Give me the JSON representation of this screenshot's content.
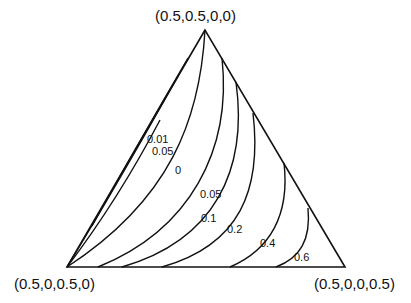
{
  "diagram": {
    "type": "ternary-contour",
    "vertices": {
      "top": "(0.5,0.5,0,0)",
      "bottom_left": "(0.5,0,0.5,0)",
      "bottom_right": "(0.5,0,0,0.5)"
    },
    "contour_labels": {
      "c001": "0.01",
      "c005a": "0.05",
      "c0": "0",
      "c005b": "0.05",
      "c01": "0.1",
      "c02": "0.2",
      "c04": "0.4",
      "c06": "0.6"
    },
    "line_color": "#111111",
    "background": "#ffffff"
  }
}
